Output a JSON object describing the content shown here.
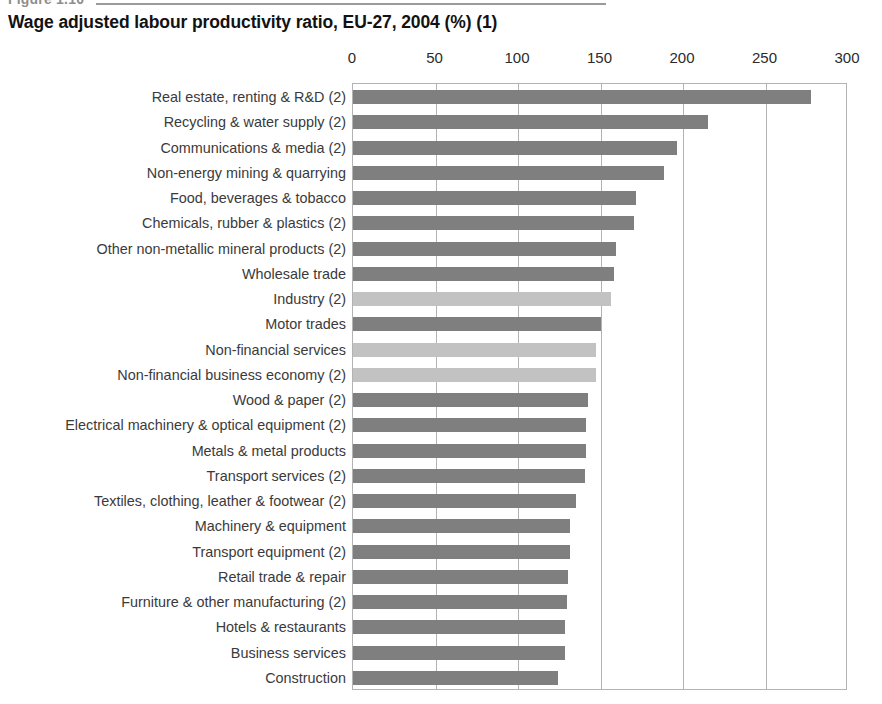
{
  "figure": {
    "label": "Figure 1.10",
    "title": "Wage adjusted labour productivity ratio, EU-27, 2004 (%) (1)"
  },
  "chart_data": {
    "type": "bar",
    "orientation": "horizontal",
    "title": "Wage adjusted labour productivity ratio, EU-27, 2004 (%) (1)",
    "xlabel": "",
    "ylabel": "",
    "xlim": [
      0,
      300
    ],
    "ticks": [
      0,
      50,
      100,
      150,
      200,
      250,
      300
    ],
    "tick_labels": [
      "0",
      "50",
      "100",
      "150",
      "200",
      "250",
      "300"
    ],
    "grid": true,
    "legend": "none",
    "colors": {
      "sector": "#7f7f7f",
      "aggregate": "#c2c2c2",
      "gridline": "#b3b3b3",
      "axis_text": "#2b2b2b",
      "label_text": "#3a3a3a"
    },
    "categories": [
      "Real estate, renting & R&D (2)",
      "Recycling & water supply (2)",
      "Communications & media (2)",
      "Non-energy mining & quarrying",
      "Food, beverages & tobacco",
      "Chemicals, rubber & plastics (2)",
      "Other non-metallic mineral products (2)",
      "Wholesale trade",
      "Industry (2)",
      "Motor trades",
      "Non-financial services",
      "Non-financial business economy (2)",
      "Wood & paper (2)",
      "Electrical machinery & optical equipment (2)",
      "Metals & metal products",
      "Transport services (2)",
      "Textiles, clothing, leather & footwear (2)",
      "Machinery & equipment",
      "Transport equipment (2)",
      "Retail trade & repair",
      "Furniture & other manufacturing (2)",
      "Hotels & restaurants",
      "Business services",
      "Construction"
    ],
    "values": [
      278,
      216,
      197,
      189,
      172,
      171,
      160,
      159,
      157,
      151,
      148,
      148,
      143,
      142,
      142,
      141,
      136,
      132,
      132,
      131,
      130,
      129,
      129,
      125
    ],
    "highlight": [
      false,
      false,
      false,
      false,
      false,
      false,
      false,
      false,
      true,
      false,
      true,
      true,
      false,
      false,
      false,
      false,
      false,
      false,
      false,
      false,
      false,
      false,
      false,
      false
    ]
  }
}
